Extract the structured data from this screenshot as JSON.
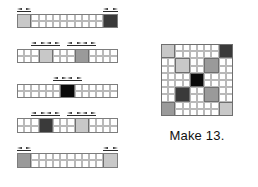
{
  "figure": {
    "caption": "Make 13.",
    "palette": {
      "white": "#ffffff",
      "light_gray": "#c8c8c8",
      "medium_gray": "#9a9a9a",
      "dark_gray": "#3a3a3a",
      "black": "#0a0a0a",
      "grid_line": "#b9b9b9",
      "outline": "#6f6f6f",
      "arrow": "#2b2b2b"
    },
    "cell_px": 7.2,
    "strips": {
      "count": 5,
      "columns": 14,
      "rows": 2,
      "origin": {
        "x": 17,
        "y": 14
      },
      "row_pitch": 34.8,
      "items": [
        {
          "index": 1,
          "name": "strip-row-1",
          "blocks": [
            {
              "color": "light_gray",
              "col": 0,
              "span": 2
            },
            {
              "color": "dark_gray",
              "col": 12,
              "span": 2
            }
          ],
          "dimensions": [
            {
              "col": 0,
              "span": 2
            },
            {
              "col": 12,
              "span": 2
            }
          ]
        },
        {
          "index": 2,
          "name": "strip-row-2",
          "blocks": [
            {
              "color": "light_gray",
              "col": 3,
              "span": 2
            },
            {
              "color": "medium_gray",
              "col": 8,
              "span": 2
            }
          ],
          "dimensions": [
            {
              "col": 2,
              "span": 2
            },
            {
              "col": 4,
              "span": 2
            },
            {
              "col": 7,
              "span": 2
            },
            {
              "col": 9,
              "span": 2
            }
          ]
        },
        {
          "index": 3,
          "name": "strip-row-3",
          "blocks": [
            {
              "color": "black",
              "col": 6,
              "span": 2
            }
          ],
          "dimensions": [
            {
              "col": 5,
              "span": 2
            },
            {
              "col": 7,
              "span": 2
            }
          ]
        },
        {
          "index": 4,
          "name": "strip-row-4",
          "blocks": [
            {
              "color": "dark_gray",
              "col": 3,
              "span": 2
            },
            {
              "color": "light_gray",
              "col": 8,
              "span": 2
            }
          ],
          "dimensions": [
            {
              "col": 2,
              "span": 2
            },
            {
              "col": 4,
              "span": 2
            },
            {
              "col": 7,
              "span": 2
            },
            {
              "col": 9,
              "span": 2
            }
          ]
        },
        {
          "index": 5,
          "name": "strip-row-5",
          "blocks": [
            {
              "color": "medium_gray",
              "col": 0,
              "span": 2
            },
            {
              "color": "light_gray",
              "col": 12,
              "span": 2
            }
          ],
          "dimensions": [
            {
              "col": 0,
              "span": 2
            },
            {
              "col": 12,
              "span": 2
            }
          ]
        }
      ]
    },
    "block_grid": {
      "name": "assembled-block",
      "columns": 10,
      "rows": 10,
      "origin": {
        "x": 161,
        "y": 44
      },
      "blocks": [
        {
          "color": "light_gray",
          "col": 0,
          "row": 0,
          "span": 2
        },
        {
          "color": "dark_gray",
          "col": 8,
          "row": 0,
          "span": 2
        },
        {
          "color": "light_gray",
          "col": 2,
          "row": 2,
          "span": 2
        },
        {
          "color": "medium_gray",
          "col": 6,
          "row": 2,
          "span": 2
        },
        {
          "color": "black",
          "col": 4,
          "row": 4,
          "span": 2
        },
        {
          "color": "dark_gray",
          "col": 2,
          "row": 6,
          "span": 2
        },
        {
          "color": "medium_gray",
          "col": 6,
          "row": 6,
          "span": 2
        },
        {
          "color": "medium_gray",
          "col": 0,
          "row": 8,
          "span": 2
        },
        {
          "color": "light_gray",
          "col": 8,
          "row": 8,
          "span": 2
        }
      ]
    }
  }
}
